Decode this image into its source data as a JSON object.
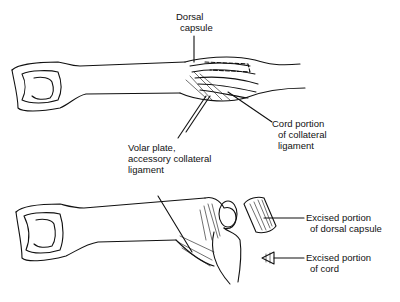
{
  "diagram": {
    "type": "anatomical-illustration",
    "panels": [
      {
        "id": "top",
        "labels": [
          {
            "id": "dorsal_capsule",
            "lines": [
              "Dorsal",
              "capsule"
            ]
          },
          {
            "id": "cord_portion",
            "lines": [
              "Cord portion",
              "of collateral",
              "ligament"
            ]
          },
          {
            "id": "volar_plate",
            "lines": [
              "Volar plate,",
              "accessory collateral",
              "ligament"
            ]
          }
        ]
      },
      {
        "id": "bottom",
        "labels": [
          {
            "id": "excised_dorsal",
            "lines": [
              "Excised portion",
              "of dorsal capsule"
            ]
          },
          {
            "id": "excised_cord",
            "lines": [
              "Excised portion",
              "of cord"
            ]
          }
        ]
      }
    ],
    "colors": {
      "ink": "#111111",
      "background": "#ffffff"
    }
  }
}
